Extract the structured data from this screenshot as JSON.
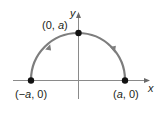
{
  "diagram": {
    "type": "semicircle-parametric-path",
    "colors": {
      "axis": "#7a7a7a",
      "curve": "#7d7d7d",
      "point": "#111111",
      "text": "#231f20"
    },
    "axes": {
      "x_label": "x",
      "y_label": "y"
    },
    "points": [
      {
        "id": "top",
        "label_pre": "(0, ",
        "label_var": "a",
        "label_post": ")"
      },
      {
        "id": "left",
        "label_pre": "(−",
        "label_var": "a",
        "label_post": ", 0)"
      },
      {
        "id": "right",
        "label_pre": "(",
        "label_var": "a",
        "label_post": ", 0)"
      }
    ],
    "curve": {
      "description": "upper semicircle of radius a traversed counterclockwise from (a, 0) to (−a, 0)",
      "direction": "counterclockwise"
    }
  }
}
